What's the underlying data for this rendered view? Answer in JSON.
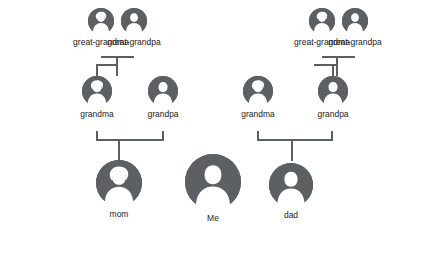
{
  "diagram": {
    "node_color": "#5d6063",
    "line_color": "#5d6063",
    "label_color": "#222222",
    "background": "#ffffff",
    "generations": [
      {
        "name": "great-grandparents",
        "nodes": [
          {
            "id": "mgg-grandma",
            "label": "great-grandma",
            "gender": "female",
            "x": 88,
            "y": 8,
            "size": 26
          },
          {
            "id": "mgg-grandpa",
            "label": "great-grandpa",
            "gender": "male",
            "x": 121,
            "y": 8,
            "size": 26
          },
          {
            "id": "pgg-grandma",
            "label": "great-grandma",
            "gender": "female",
            "x": 309,
            "y": 8,
            "size": 26
          },
          {
            "id": "pgg-grandpa",
            "label": "great-grandpa",
            "gender": "male",
            "x": 342,
            "y": 8,
            "size": 26
          }
        ]
      },
      {
        "name": "grandparents",
        "nodes": [
          {
            "id": "m-grandma",
            "label": "grandma",
            "gender": "female",
            "x": 82,
            "y": 76,
            "size": 30
          },
          {
            "id": "m-grandpa",
            "label": "grandpa",
            "gender": "male",
            "x": 148,
            "y": 76,
            "size": 30
          },
          {
            "id": "p-grandma",
            "label": "grandma",
            "gender": "female",
            "x": 243,
            "y": 76,
            "size": 30
          },
          {
            "id": "p-grandpa",
            "label": "grandpa",
            "gender": "male",
            "x": 318,
            "y": 76,
            "size": 30
          }
        ]
      },
      {
        "name": "parents-and-self",
        "nodes": [
          {
            "id": "mom",
            "label": "mom",
            "gender": "female",
            "x": 96,
            "y": 160,
            "size": 46
          },
          {
            "id": "me",
            "label": "Me",
            "gender": "male",
            "x": 185,
            "y": 154,
            "size": 56
          },
          {
            "id": "dad",
            "label": "dad",
            "gender": "male",
            "x": 269,
            "y": 163,
            "size": 44
          }
        ]
      }
    ],
    "connectors": [
      {
        "id": "mgg-couple-h",
        "orientation": "horizontal",
        "x": 101,
        "y": 56,
        "length": 33,
        "thickness": 2
      },
      {
        "id": "mgg-couple-drop",
        "orientation": "vertical",
        "x": 116,
        "y": 56,
        "length": 20,
        "thickness": 2
      },
      {
        "id": "pgg-couple-h",
        "orientation": "horizontal",
        "x": 322,
        "y": 56,
        "length": 33,
        "thickness": 2
      },
      {
        "id": "pgg-couple-drop",
        "orientation": "vertical",
        "x": 336,
        "y": 56,
        "length": 20,
        "thickness": 2
      },
      {
        "id": "mgg-to-grandma",
        "orientation": "vertical",
        "x": 96,
        "y": 66,
        "length": 12,
        "thickness": 2
      },
      {
        "id": "mgg-bracket",
        "orientation": "horizontal",
        "x": 96,
        "y": 64,
        "length": 22,
        "thickness": 2
      },
      {
        "id": "pgg-to-grandpa",
        "orientation": "vertical",
        "x": 332,
        "y": 66,
        "length": 12,
        "thickness": 2
      },
      {
        "id": "pgg-bracket",
        "orientation": "horizontal",
        "x": 314,
        "y": 64,
        "length": 22,
        "thickness": 2
      },
      {
        "id": "maternal-couple-h",
        "orientation": "horizontal",
        "x": 96,
        "y": 139,
        "length": 67,
        "thickness": 2
      },
      {
        "id": "maternal-left-riser",
        "orientation": "vertical",
        "x": 96,
        "y": 131,
        "length": 10,
        "thickness": 2
      },
      {
        "id": "maternal-right-riser",
        "orientation": "vertical",
        "x": 162,
        "y": 131,
        "length": 10,
        "thickness": 2
      },
      {
        "id": "maternal-drop",
        "orientation": "vertical",
        "x": 118,
        "y": 139,
        "length": 22,
        "thickness": 2
      },
      {
        "id": "paternal-couple-h",
        "orientation": "horizontal",
        "x": 257,
        "y": 139,
        "length": 75,
        "thickness": 2
      },
      {
        "id": "paternal-left-riser",
        "orientation": "vertical",
        "x": 257,
        "y": 131,
        "length": 10,
        "thickness": 2
      },
      {
        "id": "paternal-right-riser",
        "orientation": "vertical",
        "x": 331,
        "y": 131,
        "length": 10,
        "thickness": 2
      },
      {
        "id": "paternal-drop",
        "orientation": "vertical",
        "x": 291,
        "y": 139,
        "length": 22,
        "thickness": 2
      }
    ]
  }
}
